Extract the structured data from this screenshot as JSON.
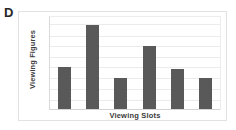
{
  "panel": {
    "label": "D"
  },
  "colors": {
    "bar": "#595959",
    "gridline": "#ebebeb",
    "axis": "#d4d4d4",
    "card_border": "#e2e2e2",
    "text": "#3a3a3a",
    "panel_label": "#262626",
    "background": "#ffffff"
  },
  "chart_data": {
    "type": "bar",
    "title": "",
    "subtitle": "",
    "panel_label": "D",
    "xlabel": "Viewing Slots",
    "ylabel": "Viewing Figures",
    "categories": [
      "1",
      "2",
      "3",
      "4",
      "5",
      "6"
    ],
    "tick_labels": {
      "x": [],
      "y": []
    },
    "values": [
      46,
      91,
      34,
      69,
      43,
      34
    ],
    "ylim": [
      0,
      100
    ],
    "grid": true,
    "gridline_count": 8,
    "legend": null,
    "legend_position": "none",
    "annotations": [],
    "series": [
      {
        "name": "Viewing Figures",
        "values": [
          46,
          91,
          34,
          69,
          43,
          34
        ]
      }
    ]
  },
  "bars": [
    {
      "index": 1,
      "height_pct": 46
    },
    {
      "index": 2,
      "height_pct": 91
    },
    {
      "index": 3,
      "height_pct": 34
    },
    {
      "index": 4,
      "height_pct": 69
    },
    {
      "index": 5,
      "height_pct": 43
    },
    {
      "index": 6,
      "height_pct": 34
    }
  ],
  "gridlines": [
    {
      "pos_pct": 8
    },
    {
      "pos_pct": 20
    },
    {
      "pos_pct": 31
    },
    {
      "pos_pct": 43
    },
    {
      "pos_pct": 54
    },
    {
      "pos_pct": 66
    },
    {
      "pos_pct": 77
    },
    {
      "pos_pct": 89
    }
  ]
}
